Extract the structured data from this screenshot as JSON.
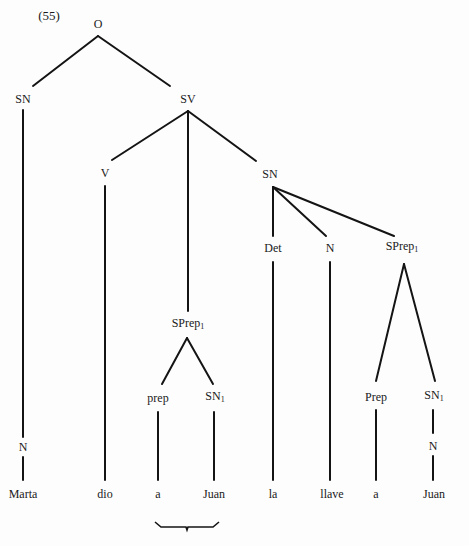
{
  "example_number": "(55)",
  "nodes": {
    "O": "O",
    "SN_subject": "SN",
    "N_subject": "N",
    "SV": "SV",
    "V": "V",
    "SPrep_mid": {
      "base": "SPrep",
      "sub": "1"
    },
    "prep_mid": "prep",
    "SN1_mid": {
      "base": "SN",
      "sub": "1"
    },
    "SN_object": "SN",
    "Det": "Det",
    "N_object": "N",
    "SPrep_right": {
      "base": "SPrep",
      "sub": "1"
    },
    "Prep_right": "Prep",
    "SN1_right": {
      "base": "SN",
      "sub": "1"
    },
    "N_right": "N"
  },
  "words": [
    "Marta",
    "dio",
    "a",
    "Juan",
    "la",
    "llave",
    "a",
    "Juan"
  ],
  "annotations": {
    "brace_under": [
      "a",
      "Juan"
    ]
  }
}
